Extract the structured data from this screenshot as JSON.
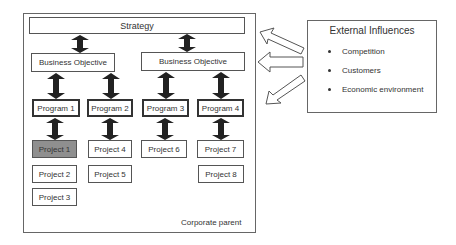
{
  "diagram": {
    "frame_label": "Corporate parent",
    "strategy": "Strategy",
    "objectives": [
      "Business Objective",
      "Business Objective"
    ],
    "programs": [
      "Program 1",
      "Program 2",
      "Program 3",
      "Program 4"
    ],
    "projects": {
      "col1": [
        "Project 1",
        "Project 2",
        "Project 3"
      ],
      "col2": [
        "Project 4",
        "Project 5"
      ],
      "col3": [
        "Project 6"
      ],
      "col4": [
        "Project 7",
        "Project 8"
      ]
    },
    "highlighted_project": "Project 1",
    "highlight_color": "#8f8f8f"
  },
  "external": {
    "title": "External Influences",
    "items": [
      "Competition",
      "Customers",
      "Economic environment"
    ]
  },
  "icons": {
    "vertical_arrows": "double-headed-arrow-icon",
    "influence_arrows": "hollow-arrow-icon"
  }
}
